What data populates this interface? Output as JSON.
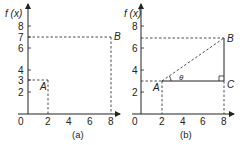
{
  "figure": {
    "panels": [
      {
        "caption": "(a)",
        "y_axis_label": "f (x)",
        "y_ticks": [
          "8",
          "7",
          "6",
          "4",
          "3",
          "2"
        ],
        "x_ticks": [
          "2",
          "4",
          "6",
          "8"
        ],
        "origin_label": "0",
        "points": [
          {
            "label": "A",
            "x": 2,
            "y": 3
          },
          {
            "label": "B",
            "x": 8,
            "y": 7
          }
        ]
      },
      {
        "caption": "(b)",
        "y_axis_label": "f (x)",
        "y_ticks": [
          "8",
          "6",
          "4",
          "2"
        ],
        "x_ticks": [
          "2",
          "4",
          "6",
          "8"
        ],
        "origin_label": "0",
        "points": [
          {
            "label": "A",
            "x": 2,
            "y": 3
          },
          {
            "label": "B",
            "x": 8,
            "y": 7
          },
          {
            "label": "C",
            "x": 8,
            "y": 3
          }
        ],
        "angle_label": "θ"
      }
    ],
    "colors": {
      "ink": "#222222",
      "background": "#ffffff"
    }
  }
}
